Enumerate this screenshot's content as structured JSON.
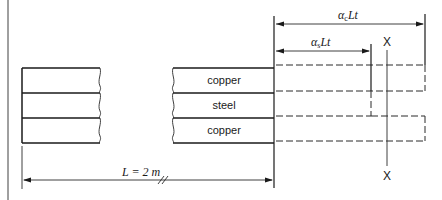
{
  "diagram": {
    "layers": [
      {
        "label": "copper",
        "position": "top"
      },
      {
        "label": "steel",
        "position": "middle"
      },
      {
        "label": "copper",
        "position": "bottom"
      }
    ],
    "dimensions": {
      "copper_expansion": {
        "alpha": "α",
        "sub": "c",
        "rest": "Lt"
      },
      "steel_expansion": {
        "alpha": "α",
        "sub": "s",
        "rest": "Lt"
      },
      "length": {
        "label": "L = 2 m"
      }
    },
    "section_marker": {
      "top": "X",
      "bottom": "X"
    },
    "colors": {
      "ink": "#1a1a1a",
      "background": "#ffffff"
    }
  }
}
